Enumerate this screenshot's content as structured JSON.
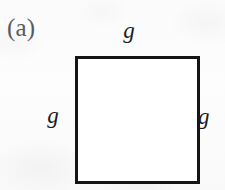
{
  "figure": {
    "panel_label": "(a)",
    "shape": "square",
    "labels": {
      "top": "g",
      "left": "g",
      "right": "g"
    },
    "colors": {
      "page_background": "#fcfcfc",
      "shape_fill": "#ffffff",
      "shape_stroke": "#151515",
      "panel_label_color": "#5b5b5b",
      "side_label_color": "#1b1b1b"
    },
    "geometry": {
      "square_left": 75,
      "square_top": 56,
      "square_width": 119,
      "square_height": 122,
      "stroke_width": 3
    }
  }
}
